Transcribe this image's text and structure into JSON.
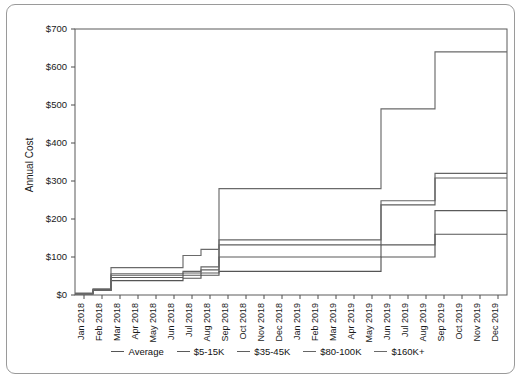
{
  "chart_data": {
    "type": "line",
    "subtype": "step",
    "title": "",
    "xlabel": "",
    "ylabel": "Annual Cost",
    "ylim": [
      0,
      700
    ],
    "ytick_labels": [
      "$0",
      "$100",
      "$200",
      "$300",
      "$400",
      "$500",
      "$600",
      "$700"
    ],
    "ytick_values": [
      0,
      100,
      200,
      300,
      400,
      500,
      600,
      700
    ],
    "grid": false,
    "legend_position": "bottom",
    "categories": [
      "Jan 2018",
      "Feb 2018",
      "Mar 2018",
      "Apr 2018",
      "May 2018",
      "Jun 2018",
      "Jul 2018",
      "Aug 2018",
      "Sep 2018",
      "Oct 2018",
      "Nov 2018",
      "Dec 2018",
      "Jan 2019",
      "Feb 2019",
      "Mar 2019",
      "Apr 2019",
      "May 2019",
      "Jun 2019",
      "Jul 2019",
      "Aug 2019",
      "Sep 2019",
      "Oct 2019",
      "Nov 2019",
      "Dec 2019"
    ],
    "series": [
      {
        "name": "Average",
        "color": "#555555",
        "values": [
          4,
          14,
          38,
          38,
          38,
          38,
          44,
          52,
          62,
          62,
          62,
          62,
          62,
          62,
          62,
          62,
          62,
          100,
          100,
          100,
          160,
          160,
          160,
          160
        ]
      },
      {
        "name": "$5-15K",
        "color": "#5a5a5a",
        "values": [
          3,
          12,
          46,
          46,
          46,
          46,
          52,
          58,
          100,
          100,
          100,
          100,
          100,
          100,
          100,
          100,
          100,
          132,
          132,
          132,
          222,
          222,
          222,
          222
        ]
      },
      {
        "name": "$35-45K",
        "color": "#5f5f5f",
        "values": [
          3,
          12,
          52,
          52,
          52,
          52,
          58,
          66,
          132,
          132,
          132,
          132,
          132,
          132,
          132,
          132,
          132,
          237,
          237,
          237,
          308,
          308,
          308,
          308
        ]
      },
      {
        "name": "$80-100K",
        "color": "#656565",
        "values": [
          3,
          13,
          56,
          56,
          56,
          56,
          62,
          74,
          145,
          145,
          145,
          145,
          145,
          145,
          145,
          145,
          145,
          248,
          248,
          248,
          320,
          320,
          320,
          320
        ]
      },
      {
        "name": "$160K+",
        "color": "#6a6a6a",
        "values": [
          5,
          16,
          72,
          72,
          72,
          72,
          104,
          120,
          280,
          280,
          280,
          280,
          280,
          280,
          280,
          280,
          280,
          490,
          490,
          490,
          640,
          640,
          640,
          640
        ]
      }
    ]
  }
}
